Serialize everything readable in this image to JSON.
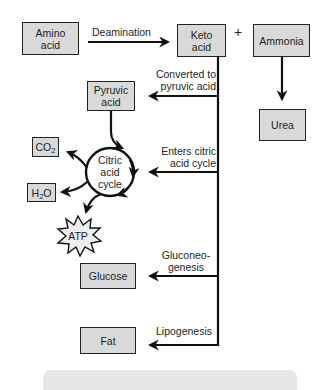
{
  "diagram": {
    "nodes": {
      "amino_acid": {
        "line1": "Amino",
        "line2": "acid"
      },
      "keto_acid": {
        "line1": "Keto",
        "line2": "acid"
      },
      "plus": "+",
      "ammonia": "Ammonia",
      "urea": "Urea",
      "pyruvic_acid": {
        "line1": "Pyruvic",
        "line2": "acid"
      },
      "citric_acid_cycle": {
        "line1": "Citric",
        "line2": "acid",
        "line3": "cycle"
      },
      "co2": {
        "main": "CO",
        "sub": "2"
      },
      "h2o": {
        "pre": "H",
        "sub": "2",
        "post": "O"
      },
      "atp": "ATP",
      "glucose": "Glucose",
      "fat": "Fat"
    },
    "edges": {
      "deamination": "Deamination",
      "converted_to_pyruvic": {
        "line1": "Converted to",
        "line2": "pyruvic acid"
      },
      "enters_citric": {
        "line1": "Enters citric",
        "line2": "acid cycle"
      },
      "gluconeogenesis": {
        "line1": "Gluconeo-",
        "line2": "genesis"
      },
      "lipogenesis": "Lipogenesis"
    },
    "colors": {
      "box_fill": "#d9d9d9",
      "line": "#111111",
      "atp_fill": "#eeeeee",
      "bottom_bar": "#e6e6e6"
    }
  }
}
